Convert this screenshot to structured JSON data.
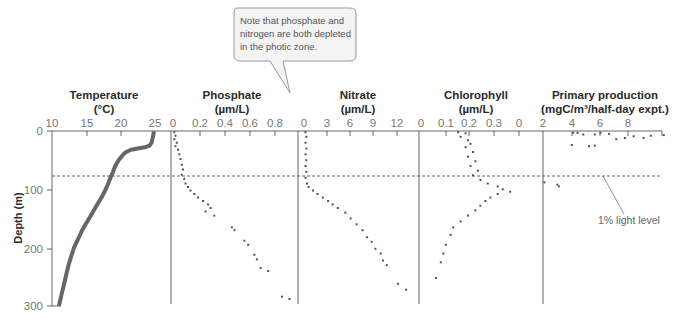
{
  "chart_data": {
    "type": "scatter",
    "title": "",
    "shared_y_axis": {
      "label": "Depth (m)",
      "ticks": [
        "0",
        "100",
        "200",
        "300"
      ],
      "range": [
        0,
        300
      ],
      "inverted": true
    },
    "annotations": {
      "callout": [
        "Note that phosphate and",
        "nitrogen are both depleted",
        "in the photic zone."
      ],
      "light_level_label": "1% light level",
      "light_level_depth_m": 78
    },
    "panels": [
      {
        "name": "Temperature",
        "title": [
          "Temperature",
          "(°C)"
        ],
        "x_ticks": [
          "10",
          "15",
          "20",
          "25"
        ],
        "xlim": [
          10,
          25
        ],
        "series": [
          {
            "depth": 0,
            "value": 24.8
          },
          {
            "depth": 5,
            "value": 24.8
          },
          {
            "depth": 10,
            "value": 24.7
          },
          {
            "depth": 15,
            "value": 24.6
          },
          {
            "depth": 20,
            "value": 24.5
          },
          {
            "depth": 25,
            "value": 24.2
          },
          {
            "depth": 28,
            "value": 23.5
          },
          {
            "depth": 30,
            "value": 22.5
          },
          {
            "depth": 32,
            "value": 21.5
          },
          {
            "depth": 36,
            "value": 20.8
          },
          {
            "depth": 40,
            "value": 20.4
          },
          {
            "depth": 50,
            "value": 19.7
          },
          {
            "depth": 60,
            "value": 19.2
          },
          {
            "depth": 70,
            "value": 18.9
          },
          {
            "depth": 80,
            "value": 18.5
          },
          {
            "depth": 90,
            "value": 18.2
          },
          {
            "depth": 100,
            "value": 17.8
          },
          {
            "depth": 110,
            "value": 17.4
          },
          {
            "depth": 120,
            "value": 16.9
          },
          {
            "depth": 130,
            "value": 16.4
          },
          {
            "depth": 140,
            "value": 15.9
          },
          {
            "depth": 150,
            "value": 15.4
          },
          {
            "depth": 160,
            "value": 14.9
          },
          {
            "depth": 170,
            "value": 14.4
          },
          {
            "depth": 180,
            "value": 14.0
          },
          {
            "depth": 190,
            "value": 13.6
          },
          {
            "depth": 200,
            "value": 13.2
          },
          {
            "depth": 215,
            "value": 12.8
          },
          {
            "depth": 230,
            "value": 12.4
          },
          {
            "depth": 245,
            "value": 12.1
          },
          {
            "depth": 260,
            "value": 11.8
          },
          {
            "depth": 275,
            "value": 11.5
          },
          {
            "depth": 290,
            "value": 11.2
          },
          {
            "depth": 300,
            "value": 11.0
          }
        ]
      },
      {
        "name": "Phosphate",
        "title": [
          "Phosphate",
          "(µm/L)"
        ],
        "x_ticks": [
          "0",
          "0.2",
          "0.4",
          "0.6",
          "0.8"
        ],
        "xlim": [
          0,
          0.95
        ],
        "series": [
          {
            "depth": 2,
            "value": 0.01
          },
          {
            "depth": 8,
            "value": 0.02
          },
          {
            "depth": 14,
            "value": 0.01
          },
          {
            "depth": 20,
            "value": 0.03
          },
          {
            "depth": 26,
            "value": 0.02
          },
          {
            "depth": 32,
            "value": 0.04
          },
          {
            "depth": 40,
            "value": 0.05
          },
          {
            "depth": 48,
            "value": 0.06
          },
          {
            "depth": 58,
            "value": 0.07
          },
          {
            "depth": 66,
            "value": 0.08
          },
          {
            "depth": 75,
            "value": 0.07
          },
          {
            "depth": 82,
            "value": 0.09
          },
          {
            "depth": 90,
            "value": 0.1
          },
          {
            "depth": 96,
            "value": 0.12
          },
          {
            "depth": 102,
            "value": 0.14
          },
          {
            "depth": 108,
            "value": 0.17
          },
          {
            "depth": 114,
            "value": 0.2
          },
          {
            "depth": 120,
            "value": 0.24
          },
          {
            "depth": 126,
            "value": 0.28
          },
          {
            "depth": 132,
            "value": 0.3
          },
          {
            "depth": 138,
            "value": 0.26
          },
          {
            "depth": 145,
            "value": 0.33
          },
          {
            "depth": 165,
            "value": 0.47
          },
          {
            "depth": 170,
            "value": 0.49
          },
          {
            "depth": 188,
            "value": 0.57
          },
          {
            "depth": 195,
            "value": 0.6
          },
          {
            "depth": 212,
            "value": 0.65
          },
          {
            "depth": 220,
            "value": 0.67
          },
          {
            "depth": 235,
            "value": 0.7
          },
          {
            "depth": 240,
            "value": 0.76
          },
          {
            "depth": 284,
            "value": 0.87
          },
          {
            "depth": 288,
            "value": 0.93
          }
        ]
      },
      {
        "name": "Nitrate",
        "title": [
          "Nitrate",
          "(µm/L)"
        ],
        "x_ticks": [
          "0",
          "3",
          "6",
          "9",
          "12"
        ],
        "xlim": [
          0,
          14.5
        ],
        "series": [
          {
            "depth": 2,
            "value": 0.2
          },
          {
            "depth": 10,
            "value": 0.3
          },
          {
            "depth": 20,
            "value": 0.2
          },
          {
            "depth": 30,
            "value": 0.3
          },
          {
            "depth": 40,
            "value": 0.2
          },
          {
            "depth": 50,
            "value": 0.3
          },
          {
            "depth": 60,
            "value": 0.2
          },
          {
            "depth": 70,
            "value": 0.3
          },
          {
            "depth": 80,
            "value": 0.2
          },
          {
            "depth": 90,
            "value": 0.4
          },
          {
            "depth": 96,
            "value": 0.6
          },
          {
            "depth": 102,
            "value": 1.2
          },
          {
            "depth": 108,
            "value": 1.8
          },
          {
            "depth": 114,
            "value": 2.5
          },
          {
            "depth": 120,
            "value": 3.2
          },
          {
            "depth": 126,
            "value": 3.8
          },
          {
            "depth": 132,
            "value": 4.5
          },
          {
            "depth": 140,
            "value": 5.5
          },
          {
            "depth": 150,
            "value": 6.2
          },
          {
            "depth": 160,
            "value": 7.0
          },
          {
            "depth": 170,
            "value": 7.8
          },
          {
            "depth": 182,
            "value": 8.4
          },
          {
            "depth": 190,
            "value": 9.0
          },
          {
            "depth": 202,
            "value": 9.5
          },
          {
            "depth": 210,
            "value": 10.2
          },
          {
            "depth": 222,
            "value": 10.5
          },
          {
            "depth": 230,
            "value": 11.0
          },
          {
            "depth": 262,
            "value": 12.5
          },
          {
            "depth": 272,
            "value": 13.6
          }
        ]
      },
      {
        "name": "Chlorophyll",
        "title": [
          "Chlorophyll",
          "(µm/L)"
        ],
        "x_ticks": [
          "0",
          "0.1",
          "0.2",
          "0.3",
          "0"
        ],
        "xlim": [
          0,
          0.4
        ],
        "series": [
          {
            "depth": 2,
            "value": 0.15
          },
          {
            "depth": 4,
            "value": 0.18
          },
          {
            "depth": 10,
            "value": 0.16
          },
          {
            "depth": 16,
            "value": 0.19
          },
          {
            "depth": 22,
            "value": 0.2
          },
          {
            "depth": 28,
            "value": 0.18
          },
          {
            "depth": 36,
            "value": 0.21
          },
          {
            "depth": 44,
            "value": 0.19
          },
          {
            "depth": 52,
            "value": 0.22
          },
          {
            "depth": 60,
            "value": 0.2
          },
          {
            "depth": 68,
            "value": 0.23
          },
          {
            "depth": 76,
            "value": 0.21
          },
          {
            "depth": 84,
            "value": 0.24
          },
          {
            "depth": 90,
            "value": 0.27
          },
          {
            "depth": 95,
            "value": 0.31
          },
          {
            "depth": 100,
            "value": 0.33
          },
          {
            "depth": 104,
            "value": 0.36
          },
          {
            "depth": 108,
            "value": 0.31
          },
          {
            "depth": 114,
            "value": 0.28
          },
          {
            "depth": 120,
            "value": 0.26
          },
          {
            "depth": 128,
            "value": 0.24
          },
          {
            "depth": 136,
            "value": 0.22
          },
          {
            "depth": 145,
            "value": 0.19
          },
          {
            "depth": 155,
            "value": 0.16
          },
          {
            "depth": 165,
            "value": 0.13
          },
          {
            "depth": 178,
            "value": 0.12
          },
          {
            "depth": 195,
            "value": 0.1
          },
          {
            "depth": 210,
            "value": 0.09
          },
          {
            "depth": 225,
            "value": 0.08
          },
          {
            "depth": 252,
            "value": 0.06
          }
        ]
      },
      {
        "name": "Primary production",
        "title": [
          "Primary production",
          "(mgC/m³/half-day expt.)"
        ],
        "x_ticks": [
          "2",
          "4",
          "6",
          "8"
        ],
        "xlim": [
          2,
          10
        ],
        "series": [
          {
            "depth": 3,
            "value": 4.1
          },
          {
            "depth": 3,
            "value": 4.4
          },
          {
            "depth": 6,
            "value": 4.8
          },
          {
            "depth": 6,
            "value": 5.6
          },
          {
            "depth": 3,
            "value": 6.0
          },
          {
            "depth": 5,
            "value": 6.6
          },
          {
            "depth": 14,
            "value": 7.1
          },
          {
            "depth": 12,
            "value": 7.7
          },
          {
            "depth": 9,
            "value": 8.3
          },
          {
            "depth": 12,
            "value": 9.0
          },
          {
            "depth": 8,
            "value": 9.5
          },
          {
            "depth": 7,
            "value": 10.4
          },
          {
            "depth": 24,
            "value": 4.0
          },
          {
            "depth": 26,
            "value": 5.2
          },
          {
            "depth": 25,
            "value": 5.6
          },
          {
            "depth": 88,
            "value": 2.1
          },
          {
            "depth": 92,
            "value": 3.0
          },
          {
            "depth": 95,
            "value": 3.1
          }
        ]
      }
    ]
  }
}
